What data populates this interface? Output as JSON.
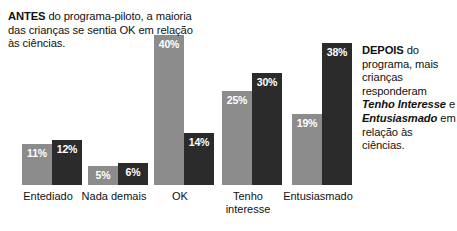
{
  "annotations": {
    "left": {
      "strong": "ANTES",
      "rest": " do programa-piloto, a maioria das crianças se sentia OK em relação às ciências."
    },
    "right": {
      "strong": "DEPOIS",
      "part1": " do programa, mais crianças responderam ",
      "em1": "Tenho Interesse",
      "part2": " e ",
      "em2": "Entusiasmado",
      "part3": " em relação às ciências."
    }
  },
  "colors": {
    "before_bar": "#8c8c8c",
    "after_bar": "#2b2b2b",
    "background": "#ffffff",
    "text": "#111111",
    "value_label": "#ffffff"
  },
  "chart_data": {
    "type": "bar",
    "title": "",
    "subtitle": "",
    "xlabel": "",
    "ylabel": "",
    "ylim": [
      0,
      42
    ],
    "grid": false,
    "legend": false,
    "legend_position": "none",
    "orientation": "vertical",
    "grouping": "grouped",
    "value_suffix": "%",
    "categories": [
      "Entediado",
      "Nada demais",
      "OK",
      "Tenho\ninteresse",
      "Entusiasmado"
    ],
    "series": [
      {
        "name": "ANTES",
        "color": "#8c8c8c",
        "values": [
          11,
          5,
          40,
          25,
          19
        ]
      },
      {
        "name": "DEPOIS",
        "color": "#2b2b2b",
        "values": [
          12,
          6,
          14,
          30,
          38
        ]
      }
    ],
    "labels": {
      "before": [
        "11%",
        "5%",
        "40%",
        "25%",
        "19%"
      ],
      "after": [
        "12%",
        "6%",
        "14%",
        "30%",
        "38%"
      ]
    },
    "annotations": [
      "ANTES do programa-piloto, a maioria das crianças se sentia OK em relação às ciências.",
      "DEPOIS do programa, mais crianças responderam Tenho Interesse e Entusiasmado em relação às ciências."
    ]
  },
  "layout": {
    "baseline_y": 185,
    "px_per_unit": 3.75,
    "groups": [
      {
        "left": 22,
        "bar_width": 30,
        "label_left": -2,
        "label_width": 100
      },
      {
        "left": 88,
        "bar_width": 30,
        "label_left": 64,
        "label_width": 100
      },
      {
        "left": 154,
        "bar_width": 30,
        "label_left": 130,
        "label_width": 100
      },
      {
        "left": 222,
        "bar_width": 30,
        "label_left": 198,
        "label_width": 100
      },
      {
        "left": 292,
        "bar_width": 30,
        "label_left": 268,
        "label_width": 100
      }
    ]
  }
}
